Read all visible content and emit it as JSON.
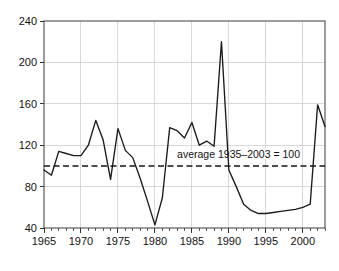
{
  "chart_data": {
    "type": "line",
    "title": "",
    "subtitle": "",
    "xlabel": "",
    "ylabel": "",
    "xlim": [
      1965,
      2003
    ],
    "ylim": [
      40,
      240
    ],
    "grid": true,
    "legend_position": "none",
    "x_ticks": [
      1965,
      1970,
      1975,
      1980,
      1985,
      1990,
      1995,
      2000
    ],
    "x_tick_labels": [
      "1965",
      "1970",
      "1975",
      "1980",
      "1985",
      "1990",
      "1995",
      "2000"
    ],
    "x_minor_tick_step": 1,
    "y_ticks": [
      40,
      80,
      120,
      160,
      200,
      240
    ],
    "y_tick_labels": [
      "40",
      "80",
      "120",
      "160",
      "200",
      "240"
    ],
    "series": [
      {
        "name": "index",
        "color": "#1a1a1a",
        "x": [
          1965,
          1966,
          1967,
          1968,
          1969,
          1970,
          1971,
          1972,
          1973,
          1974,
          1975,
          1976,
          1977,
          1978,
          1979,
          1980,
          1981,
          1982,
          1983,
          1984,
          1985,
          1986,
          1987,
          1988,
          1989,
          1990,
          1991,
          1992,
          1993,
          1994,
          1995,
          1996,
          1997,
          1998,
          1999,
          2000,
          2001,
          2002,
          2003
        ],
        "values": [
          96,
          91,
          114,
          112,
          110,
          110,
          120,
          144,
          125,
          87,
          136,
          115,
          108,
          88,
          66,
          43,
          69,
          137,
          134,
          127,
          142,
          120,
          124,
          119,
          220,
          96,
          80,
          63,
          57,
          54,
          54,
          55,
          56,
          57,
          58,
          60,
          63,
          159,
          138
        ]
      }
    ],
    "annotations": [
      {
        "type": "hline",
        "name": "average-reference-line",
        "value": 100,
        "style": "dashed",
        "color": "#151515",
        "label": "average  1935–2003 = 100",
        "label_x": 1983.0,
        "label_y": 108
      }
    ]
  },
  "axis": {
    "y_min_label": "40",
    "y_max_label": "240"
  }
}
